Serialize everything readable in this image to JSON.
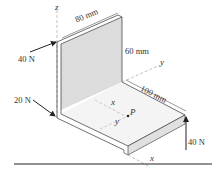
{
  "figure": {
    "type": "statics-diagram"
  },
  "dimensions": {
    "width_label": "80 mm",
    "height_label": "60 mm",
    "length_label": "100 mm"
  },
  "forces": [
    {
      "id": "force-top-left",
      "label": "40 N"
    },
    {
      "id": "force-bottom-left",
      "label": "20 N"
    },
    {
      "id": "force-right",
      "label": "40 N"
    }
  ],
  "axes": {
    "z": "z",
    "y_top": "y",
    "x_mid": "x",
    "y_mid": "y",
    "x_bottom": "x"
  },
  "point": {
    "label": "P"
  },
  "colors": {
    "line": "#333333",
    "plate_face": "#dcdcdc",
    "plate_edge_face": "#e6e6e6",
    "axis_line": "#999999",
    "background": "#ffffff"
  }
}
